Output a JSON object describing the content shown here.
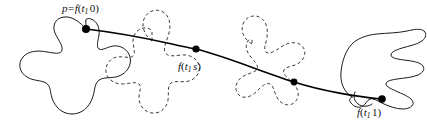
{
  "figure": {
    "background_color": "#ffffff",
    "stroke_color": "#1a1a1a",
    "dashed_stroke_color": "#3a3a3a",
    "curve_color": "#000000",
    "dot_color": "#000000",
    "width": 427,
    "height": 125
  },
  "labels": {
    "start": {
      "full_text": "p = f(t 1 0)",
      "point_symbol": "p",
      "equals": "=",
      "function": "f",
      "open_paren": "(",
      "variable": "t",
      "subscript": "1",
      "argument": "0",
      "close_paren": ")"
    },
    "middle": {
      "full_text": "f(t 1 s)",
      "function": "f",
      "open_paren": "(",
      "variable": "t",
      "subscript": "1",
      "argument": "s",
      "close_paren": ")"
    },
    "end": {
      "full_text": "f(t 1 1)",
      "function": "f",
      "open_paren": "(",
      "variable": "t",
      "subscript": "1",
      "argument": "1",
      "close_paren": ")"
    }
  },
  "shapes": [
    {
      "name": "blob-start",
      "style": "solid",
      "position": "left"
    },
    {
      "name": "blob-intermediate-1",
      "style": "dashed",
      "position": "center-left"
    },
    {
      "name": "blob-intermediate-2",
      "style": "dashed",
      "position": "center-right"
    },
    {
      "name": "blob-end",
      "style": "solid",
      "position": "right"
    }
  ],
  "nodes": [
    {
      "name": "node-start",
      "x": 86,
      "y": 29,
      "label": "p = f(t 1 0)"
    },
    {
      "name": "node-middle",
      "x": 196,
      "y": 49,
      "label": "f(t 1 s)"
    },
    {
      "name": "node-third",
      "x": 294,
      "y": 82,
      "label": ""
    },
    {
      "name": "node-end",
      "x": 382,
      "y": 99,
      "label": "f(t 1 1)"
    }
  ]
}
